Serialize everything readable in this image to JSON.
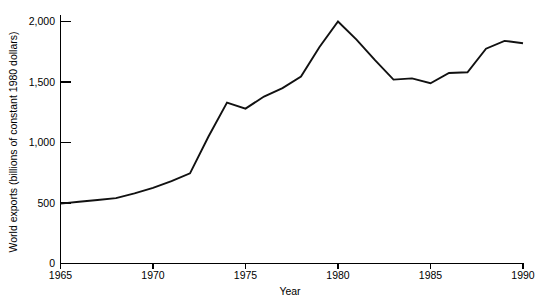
{
  "chart_data": {
    "type": "line",
    "title": "",
    "xlabel": "Year",
    "ylabel": "World exports (billions of constant 1980 dollars)",
    "xlim": [
      1965,
      1990
    ],
    "ylim": [
      0,
      2000
    ],
    "xticks": [
      1965,
      1970,
      1975,
      1980,
      1985,
      1990
    ],
    "xtick_labels": [
      "1965",
      "1970",
      "1975",
      "1980",
      "1985",
      "1990"
    ],
    "yticks": [
      0,
      500,
      1000,
      1500,
      2000
    ],
    "ytick_labels": [
      "0",
      "500",
      "1,000",
      "1,500",
      "2,000"
    ],
    "grid": false,
    "legend": null,
    "line_color": "#111111",
    "x": [
      1965,
      1966,
      1967,
      1968,
      1969,
      1970,
      1971,
      1972,
      1973,
      1974,
      1975,
      1976,
      1977,
      1978,
      1979,
      1980,
      1981,
      1982,
      1983,
      1984,
      1985,
      1986,
      1987,
      1988,
      1989,
      1990
    ],
    "values": [
      495,
      510,
      525,
      540,
      580,
      625,
      680,
      745,
      1050,
      1330,
      1280,
      1380,
      1450,
      1545,
      1790,
      2000,
      1850,
      1680,
      1520,
      1530,
      1490,
      1575,
      1580,
      1775,
      1840,
      1820
    ],
    "series": [
      {
        "name": "World exports",
        "values": [
          495,
          510,
          525,
          540,
          580,
          625,
          680,
          745,
          1050,
          1330,
          1280,
          1380,
          1450,
          1545,
          1790,
          2000,
          1850,
          1680,
          1520,
          1530,
          1490,
          1575,
          1580,
          1775,
          1840,
          1820
        ]
      }
    ],
    "annotations": []
  },
  "axes": {
    "y_title": "World exports (billions of constant 1980 dollars)",
    "x_title": "Year",
    "y_labels": {
      "t0": "0",
      "t1": "500",
      "t2": "1,000",
      "t3": "1,500",
      "t4": "2,000"
    },
    "x_labels": {
      "t0": "1965",
      "t1": "1970",
      "t2": "1975",
      "t3": "1980",
      "t4": "1985",
      "t5": "1990"
    }
  }
}
